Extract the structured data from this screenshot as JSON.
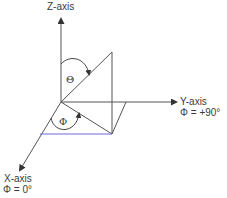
{
  "diagram": {
    "type": "spherical-coordinate-system",
    "axes": {
      "z": {
        "label": "Z-axis"
      },
      "y": {
        "label": "Y-axis",
        "phi_label": "Φ = +90°"
      },
      "x": {
        "label": "X-axis",
        "phi_label": "Φ = 0°"
      }
    },
    "angles": {
      "theta": {
        "symbol": "Θ"
      },
      "phi": {
        "symbol": "Φ"
      }
    },
    "colors": {
      "line": "#555555",
      "projection_line": "#6b6bd6",
      "text": "#3a3a3a"
    }
  }
}
